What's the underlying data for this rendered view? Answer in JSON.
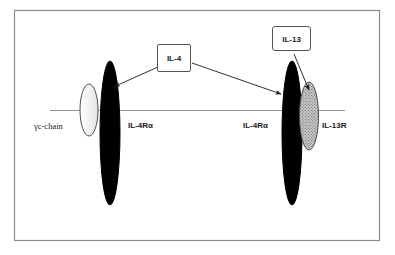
{
  "figure": {
    "background_color": "#ffffff",
    "border_color": "#8c8c8c",
    "membrane_line_color": "#808080",
    "stroke_color": "#1a1a1a"
  },
  "ligands": [
    {
      "id": "il4",
      "label": "IL-4",
      "box_fill": "#ffffff",
      "box_stroke": "#555555"
    },
    {
      "id": "il13",
      "label": "IL-13",
      "box_fill": "#ffffff",
      "box_stroke": "#555555"
    }
  ],
  "receptors": [
    {
      "id": "gc-chain",
      "label": "γc-chain",
      "fill": "#f2f2f2",
      "stroke": "#4d4d4d",
      "style": "light"
    },
    {
      "id": "il4ra-left",
      "label": "IL-4Rα",
      "fill": "#000000",
      "stroke": "#000000",
      "style": "solid-black"
    },
    {
      "id": "il4ra-right",
      "label": "IL-4Rα",
      "fill": "#000000",
      "stroke": "#000000",
      "style": "solid-black"
    },
    {
      "id": "il13r",
      "label": "IL-13R",
      "fill": "#b3b3b3",
      "stroke": "#4d4d4d",
      "style": "stippled-gray"
    }
  ],
  "arrows": [
    {
      "id": "il4-to-il4ra-left",
      "from": "IL-4",
      "to": "IL-4Rα"
    },
    {
      "id": "il4-to-il4ra-right",
      "from": "IL-4",
      "to": "IL-4Rα"
    },
    {
      "id": "il13-to-il13r",
      "from": "IL-13",
      "to": "IL-13R"
    }
  ]
}
